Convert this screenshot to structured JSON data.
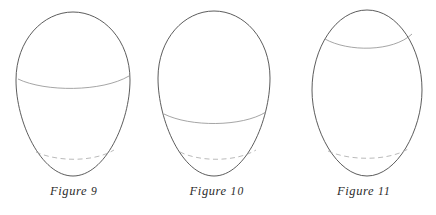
{
  "document": {
    "kind": "geometric-diagram-plate",
    "background_color": "#ffffff",
    "outline_color": "#4a4a4a",
    "section_line_color": "#8e8e8e",
    "dashed_line_color": "#a8a8a8",
    "caption_color": "#2b2b2b"
  },
  "figures": [
    {
      "id": "figure-9",
      "caption_label": "Figure",
      "caption_number": "9",
      "caption_full": "Figure 9",
      "shape": "ovoid",
      "outline": {
        "top_y": 12,
        "bottom_y": 176,
        "left_x": 16,
        "right_x": 130,
        "widest_y": 82,
        "center_x": 73,
        "width": 114,
        "height": 164
      },
      "section_lines": [
        {
          "name": "upper-section-solid",
          "style": "solid",
          "y": 81,
          "left_x": 18,
          "right_x": 129,
          "sag": 6,
          "position_note": "intersects outline just below widest point"
        },
        {
          "name": "lower-section-dashed",
          "style": "dashed",
          "y": 154,
          "left_x": 36,
          "right_x": 114,
          "sag": 7,
          "position_note": "hidden rear edge near base"
        }
      ]
    },
    {
      "id": "figure-10",
      "caption_label": "Figure",
      "caption_number": "10",
      "caption_full": "Figure 10",
      "shape": "ovoid",
      "outline": {
        "top_y": 11,
        "bottom_y": 176,
        "left_x": 12,
        "right_x": 124,
        "widest_y": 80,
        "center_x": 68,
        "width": 112,
        "height": 165
      },
      "section_lines": [
        {
          "name": "lower-section-solid",
          "style": "solid",
          "y": 116,
          "left_x": 18,
          "right_x": 120,
          "sag": 7,
          "position_note": "well below widest point"
        },
        {
          "name": "base-section-dashed",
          "style": "dashed",
          "y": 154,
          "left_x": 34,
          "right_x": 110,
          "sag": 7,
          "position_note": "hidden rear edge near base"
        }
      ]
    },
    {
      "id": "figure-11",
      "caption_label": "Figure",
      "caption_number": "11",
      "caption_full": "Figure 11",
      "shape": "ovoid",
      "outline": {
        "top_y": 10,
        "bottom_y": 176,
        "left_x": 20,
        "right_x": 130,
        "widest_y": 92,
        "center_x": 75,
        "width": 110,
        "height": 166
      },
      "section_lines": [
        {
          "name": "top-section-solid",
          "style": "solid",
          "y": 40,
          "left_x": 33,
          "right_x": 120,
          "sag": 6,
          "position_note": "near the crown of the ovoid"
        },
        {
          "name": "base-section-dashed",
          "style": "dashed",
          "y": 153,
          "left_x": 36,
          "right_x": 116,
          "sag": 7,
          "position_note": "hidden rear edge near base"
        }
      ]
    }
  ]
}
